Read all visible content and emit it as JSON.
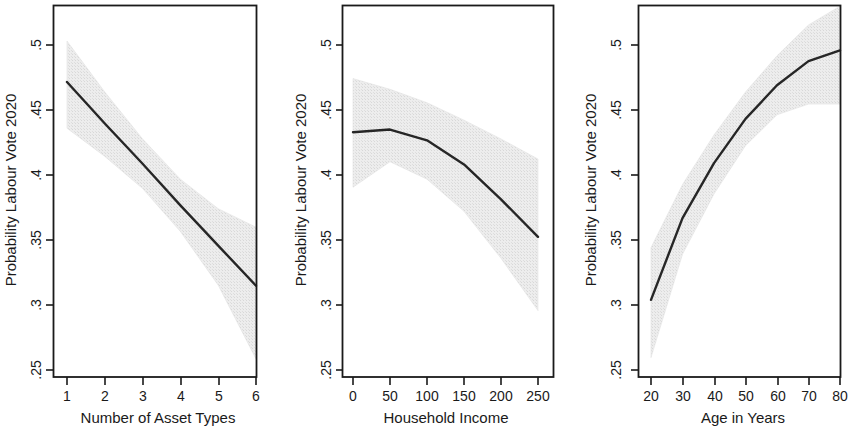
{
  "figure": {
    "panel_count": 3,
    "background_color": "#ffffff",
    "line_color": "#262626",
    "band_color": "#e6e6e6",
    "axis_color": "#1a1a1a"
  },
  "chart_data": [
    {
      "type": "line",
      "title": "",
      "xlabel": "Number of Asset Types",
      "ylabel": "Probability Labour Vote 2020",
      "xlim": [
        0.6,
        6.4
      ],
      "ylim": [
        0.238,
        0.515
      ],
      "xticks": [
        1,
        2,
        3,
        4,
        5,
        6
      ],
      "xticklabels": [
        "1",
        "2",
        "3",
        "4",
        "5",
        "6"
      ],
      "yticks": [
        0.25,
        0.3,
        0.35,
        0.4,
        0.45,
        0.5
      ],
      "yticklabels": [
        ".25",
        ".3",
        ".35",
        ".4",
        ".45",
        ".5"
      ],
      "grid": false,
      "legend": "none",
      "x": [
        1,
        2,
        3,
        4,
        5,
        6
      ],
      "series": [
        {
          "name": "Predicted probability",
          "values": [
            0.458,
            0.427,
            0.397,
            0.366,
            0.336,
            0.306
          ]
        },
        {
          "name": "95% CI upper",
          "values": [
            0.4885,
            0.4505,
            0.4155,
            0.3855,
            0.3635,
            0.3497
          ]
        },
        {
          "name": "95% CI lower",
          "values": [
            0.4235,
            0.4025,
            0.3785,
            0.3465,
            0.3065,
            0.2515
          ]
        }
      ]
    },
    {
      "type": "line",
      "title": "",
      "xlabel": "Household Income",
      "ylabel": "Probability Labour Vote 2020",
      "xlim": [
        -18,
        268
      ],
      "ylim": [
        0.238,
        0.515
      ],
      "xticks": [
        0,
        50,
        100,
        150,
        200,
        250
      ],
      "xticklabels": [
        "0",
        "50",
        "100",
        "150",
        "200",
        "250"
      ],
      "yticks": [
        0.25,
        0.3,
        0.35,
        0.4,
        0.45,
        0.5
      ],
      "yticklabels": [
        ".25",
        ".3",
        ".35",
        ".4",
        ".45",
        ".5"
      ],
      "grid": false,
      "legend": "none",
      "x": [
        0,
        50,
        100,
        150,
        200,
        250
      ],
      "series": [
        {
          "name": "Predicted probability",
          "values": [
            0.4205,
            0.4225,
            0.4145,
            0.3965,
            0.3705,
            0.3425
          ]
        },
        {
          "name": "95% CI upper",
          "values": [
            0.4605,
            0.4525,
            0.4425,
            0.4295,
            0.4155,
            0.4005
          ]
        },
        {
          "name": "95% CI lower",
          "values": [
            0.3795,
            0.3985,
            0.3855,
            0.3615,
            0.3265,
            0.2875
          ]
        }
      ]
    },
    {
      "type": "line",
      "title": "",
      "xlabel": "Age in Years",
      "ylabel": "Probability Labour Vote 2020",
      "xlim": [
        16,
        84
      ],
      "ylim": [
        0.238,
        0.515
      ],
      "xticks": [
        20,
        30,
        40,
        50,
        60,
        70,
        80
      ],
      "xticklabels": [
        "20",
        "30",
        "40",
        "50",
        "60",
        "70",
        "80"
      ],
      "yticks": [
        0.25,
        0.3,
        0.35,
        0.4,
        0.45,
        0.5
      ],
      "yticklabels": [
        ".25",
        ".3",
        ".35",
        ".4",
        ".45",
        ".5"
      ],
      "grid": false,
      "legend": "none",
      "x": [
        20,
        30,
        40,
        50,
        60,
        70,
        80
      ],
      "series": [
        {
          "name": "Predicted probability",
          "values": [
            0.2955,
            0.3565,
            0.3975,
            0.4305,
            0.4555,
            0.4735,
            0.4815
          ]
        },
        {
          "name": "95% CI upper",
          "values": [
            0.3345,
            0.3815,
            0.4185,
            0.4505,
            0.4775,
            0.5005,
            0.5145
          ]
        },
        {
          "name": "95% CI lower",
          "values": [
            0.2525,
            0.3295,
            0.3745,
            0.4105,
            0.4335,
            0.4415,
            0.4415
          ]
        }
      ]
    }
  ],
  "panels": [
    {
      "id": "panel-asset-types",
      "ylabel": "Probability Labour Vote 2020",
      "xlabel": "Number of Asset Types",
      "yticklabels": [
        ".5",
        ".45",
        ".4",
        ".35",
        ".3",
        ".25"
      ],
      "xticklabels": [
        "1",
        "2",
        "3",
        "4",
        "5",
        "6"
      ]
    },
    {
      "id": "panel-household-income",
      "ylabel": "Probability Labour Vote 2020",
      "xlabel": "Household Income",
      "yticklabels": [
        ".5",
        ".45",
        ".4",
        ".35",
        ".3",
        ".25"
      ],
      "xticklabels": [
        "0",
        "50",
        "100",
        "150",
        "200",
        "250"
      ]
    },
    {
      "id": "panel-age",
      "ylabel": "Probability Labour Vote 2020",
      "xlabel": "Age in Years",
      "yticklabels": [
        ".5",
        ".45",
        ".4",
        ".35",
        ".3",
        ".25"
      ],
      "xticklabels": [
        "20",
        "30",
        "40",
        "50",
        "60",
        "70",
        "80"
      ]
    }
  ]
}
